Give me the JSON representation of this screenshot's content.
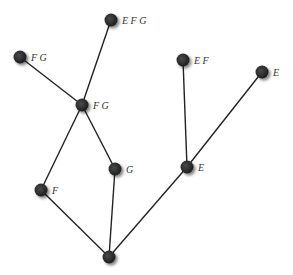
{
  "diagram": {
    "type": "lattice",
    "nodes": [
      {
        "id": "n_efg",
        "x": 111,
        "y": 20,
        "label": "E F G"
      },
      {
        "id": "n_fg_left",
        "x": 20,
        "y": 57,
        "label": "F G"
      },
      {
        "id": "n_fg_mid",
        "x": 82,
        "y": 105,
        "label": "F  G"
      },
      {
        "id": "n_ef",
        "x": 183,
        "y": 60,
        "label": "E F"
      },
      {
        "id": "n_e_right",
        "x": 262,
        "y": 72,
        "label": "E"
      },
      {
        "id": "n_g",
        "x": 115,
        "y": 169,
        "label": "G"
      },
      {
        "id": "n_e_mid",
        "x": 187,
        "y": 167,
        "label": "E"
      },
      {
        "id": "n_f",
        "x": 41,
        "y": 190,
        "label": "F"
      },
      {
        "id": "n_root",
        "x": 109,
        "y": 257,
        "label": ""
      }
    ],
    "edges": [
      [
        "n_efg",
        "n_fg_mid"
      ],
      [
        "n_fg_left",
        "n_fg_mid"
      ],
      [
        "n_fg_mid",
        "n_f"
      ],
      [
        "n_fg_mid",
        "n_g"
      ],
      [
        "n_ef",
        "n_e_mid"
      ],
      [
        "n_e_right",
        "n_e_mid"
      ],
      [
        "n_f",
        "n_root"
      ],
      [
        "n_g",
        "n_root"
      ],
      [
        "n_e_mid",
        "n_root"
      ]
    ],
    "colors": {
      "node": "#2b2b2b",
      "edge": "#222222",
      "label": "#333333"
    }
  }
}
